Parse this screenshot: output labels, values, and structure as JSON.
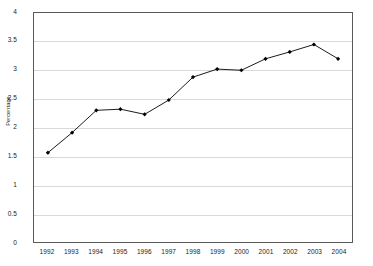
{
  "chart_data": {
    "type": "line",
    "title": "",
    "xlabel": "",
    "ylabel": "Percentage",
    "categories": [
      "1992",
      "1993",
      "1994",
      "1995",
      "1996",
      "1997",
      "1998",
      "1999",
      "2000",
      "2001",
      "2002",
      "2003",
      "2004"
    ],
    "values": [
      1.56,
      1.91,
      2.3,
      2.32,
      2.23,
      2.48,
      2.88,
      3.02,
      3.0,
      3.2,
      3.32,
      3.45,
      3.2
    ],
    "series": [
      {
        "name": "Percentage",
        "values": [
          1.56,
          1.91,
          2.3,
          2.32,
          2.23,
          2.48,
          2.88,
          3.02,
          3.0,
          3.2,
          3.32,
          3.45,
          3.2
        ]
      }
    ],
    "ylim": [
      0,
      4
    ],
    "ytick_step": 0.5,
    "yticks": [
      "0",
      "0.5",
      "1",
      "1.5",
      "2",
      "2.5",
      "3",
      "3.5",
      "4"
    ],
    "grid": true,
    "grid_axis": "y",
    "legend": false,
    "legend_position": "none",
    "marker": "diamond",
    "colors": {
      "line": "#000000",
      "marker": "#000000",
      "gridline": "#d9d9d9",
      "axis": "#595959",
      "background": "#ffffff",
      "text": "#1a1a1a"
    }
  }
}
